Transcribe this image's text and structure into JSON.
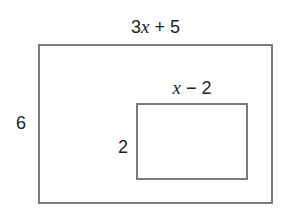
{
  "diagram": {
    "type": "nested-rectangles",
    "outer_rectangle": {
      "width_label": {
        "coefficient": "3",
        "variable": "x",
        "rest": " + 5"
      },
      "height_label": "6"
    },
    "inner_rectangle": {
      "width_label": {
        "coefficient": "",
        "variable": "x",
        "rest": " − 2"
      },
      "height_label": "2"
    },
    "colors": {
      "stroke": "#7a7a7a",
      "text": "#222222",
      "background": "#ffffff"
    }
  }
}
